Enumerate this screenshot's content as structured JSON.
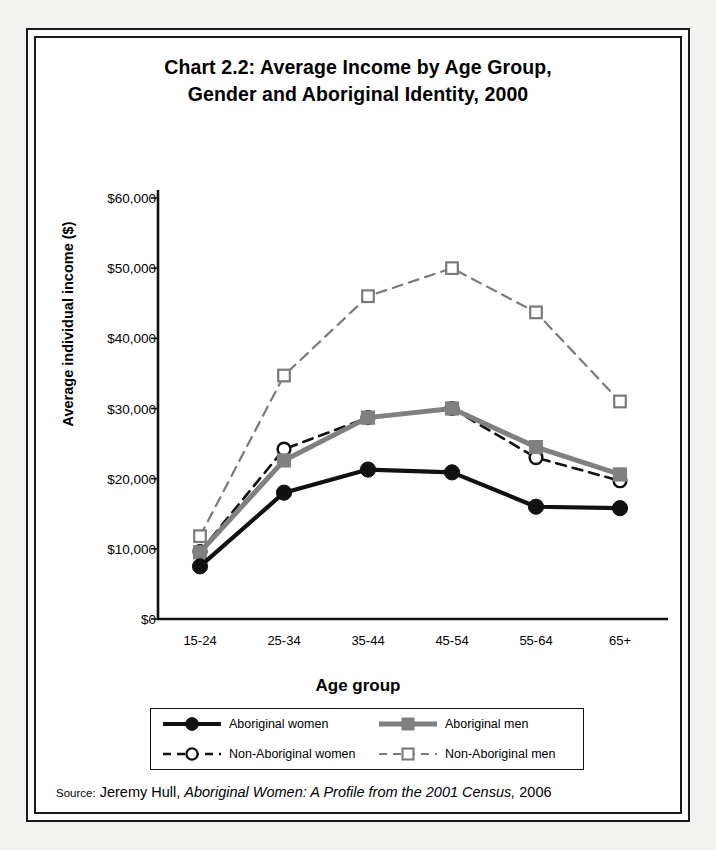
{
  "chart_data": {
    "type": "line",
    "title": "Chart 2.2:  Average Income by Age Group, Gender and Aboriginal Identity, 2000",
    "title_line1": "Chart 2.2:  Average Income by Age Group,",
    "title_line2": "Gender and Aboriginal Identity, 2000",
    "xlabel": "Age group",
    "ylabel": "Average individual income ($)",
    "categories": [
      "15-24",
      "25-34",
      "35-44",
      "45-54",
      "55-64",
      "65+"
    ],
    "ytick_labels": [
      "$60,000",
      "$50,000",
      "$40,000",
      "$30,000",
      "$20,000",
      "$10,000",
      "$0"
    ],
    "ytick_values": [
      60000,
      50000,
      40000,
      30000,
      20000,
      10000,
      0
    ],
    "ylim": [
      0,
      60000
    ],
    "grid": false,
    "legend_position": "bottom",
    "series": [
      {
        "name": "Aboriginal women",
        "values": [
          7500,
          18000,
          21300,
          20900,
          16000,
          15800
        ],
        "color": "#111111",
        "line_style": "solid",
        "marker": "filled-circle",
        "line_width": 4.2
      },
      {
        "name": "Aboriginal men",
        "values": [
          9500,
          22600,
          28700,
          30000,
          24500,
          20600
        ],
        "color": "#808080",
        "line_style": "solid",
        "marker": "filled-square",
        "line_width": 5.0
      },
      {
        "name": "Non-Aboriginal women",
        "values": [
          9600,
          24200,
          28700,
          30000,
          23000,
          19700
        ],
        "color": "#111111",
        "line_style": "dashed",
        "marker": "open-circle",
        "line_width": 2.6
      },
      {
        "name": "Non-Aboriginal men",
        "values": [
          11800,
          34700,
          46000,
          50000,
          43700,
          31000
        ],
        "color": "#7a7a7a",
        "line_style": "dashed",
        "marker": "open-square",
        "line_width": 2.2
      }
    ]
  },
  "source": {
    "label": "Source:",
    "author": "Jeremy Hull,",
    "title_italic": "Aboriginal Women: A Profile from the 2001 Census,",
    "year": "2006"
  }
}
